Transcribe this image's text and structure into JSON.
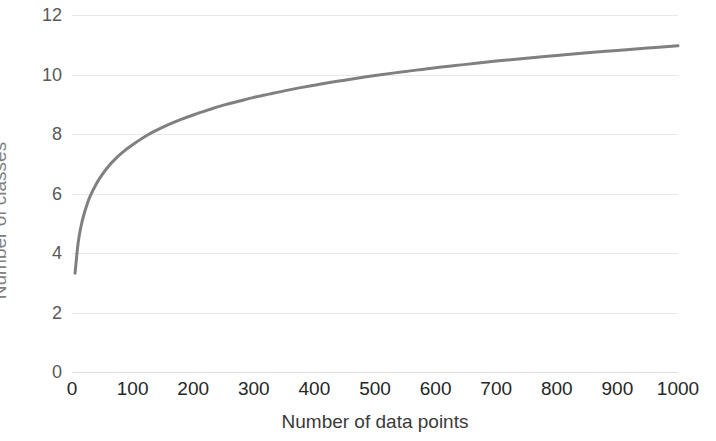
{
  "chart_data": {
    "type": "line",
    "title": "",
    "xlabel": "Number of data points",
    "ylabel": "Number of classes",
    "xlim": [
      0,
      1000
    ],
    "ylim": [
      0,
      12
    ],
    "grid": true,
    "grid_axis": "y",
    "legend": "none",
    "formula": "k = log2(n) + 1",
    "line_color": "#808080",
    "line_width": 3,
    "x_ticks": [
      0,
      100,
      200,
      300,
      400,
      500,
      600,
      700,
      800,
      900,
      1000
    ],
    "x_tick_labels": [
      "0",
      "100",
      "200",
      "300",
      "400",
      "500",
      "600",
      "700",
      "800",
      "900",
      "1000"
    ],
    "y_ticks": [
      0,
      2,
      4,
      6,
      8,
      10,
      12
    ],
    "y_tick_labels": [
      "0",
      "2",
      "4",
      "6",
      "8",
      "10",
      "12"
    ],
    "series": [
      {
        "name": "Number of classes",
        "x": [
          5,
          10,
          15,
          20,
          25,
          30,
          40,
          50,
          60,
          70,
          80,
          90,
          100,
          120,
          140,
          160,
          180,
          200,
          225,
          250,
          275,
          300,
          325,
          350,
          375,
          400,
          425,
          450,
          475,
          500,
          550,
          600,
          650,
          700,
          750,
          800,
          850,
          900,
          950,
          1000
        ],
        "y": [
          3.32,
          4.32,
          4.91,
          5.32,
          5.64,
          5.91,
          6.32,
          6.64,
          6.91,
          7.13,
          7.32,
          7.49,
          7.64,
          7.91,
          8.13,
          8.32,
          8.49,
          8.64,
          8.81,
          8.97,
          9.1,
          9.23,
          9.34,
          9.45,
          9.55,
          9.64,
          9.73,
          9.81,
          9.89,
          9.97,
          10.1,
          10.23,
          10.34,
          10.45,
          10.55,
          10.64,
          10.73,
          10.81,
          10.89,
          10.97
        ]
      }
    ]
  },
  "axes": {
    "y_title": "Number of classes",
    "x_title": "Number of data points"
  },
  "colors": {
    "line": "#808080",
    "gridline": "#e8e8e8",
    "y_label_text": "#595959",
    "x_label_text": "#262626",
    "axis_title_text": "#808080",
    "background": "#ffffff"
  }
}
